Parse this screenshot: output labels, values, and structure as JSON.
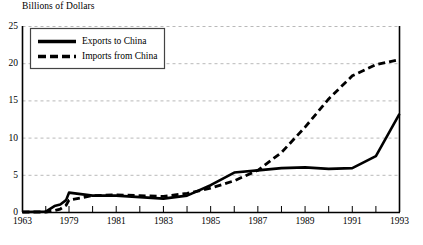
{
  "chart_data": {
    "type": "line",
    "title": "Billions of Dollars",
    "xlabel": "",
    "ylabel": "Billions of Dollars",
    "ylim": [
      0,
      25
    ],
    "yticks": [
      0,
      5,
      10,
      15,
      20,
      25
    ],
    "xticks": [
      "1963",
      "1979",
      "1981",
      "1983",
      "1985",
      "1987",
      "1989",
      "1991",
      "1993"
    ],
    "grid": "horizontal-dashed",
    "legend_position": "top-left-inside",
    "series": [
      {
        "name": "Exports to China",
        "style": "solid",
        "color": "#000000",
        "x": [
          1963,
          1971,
          1974,
          1976,
          1978,
          1979,
          1980,
          1981,
          1982,
          1983,
          1984,
          1985,
          1986,
          1987,
          1988,
          1989,
          1990,
          1991,
          1992,
          1993
        ],
        "values": [
          0.0,
          0.05,
          0.8,
          1.0,
          1.6,
          2.6,
          2.2,
          2.2,
          2.0,
          1.8,
          2.2,
          3.6,
          5.3,
          5.6,
          5.9,
          6.0,
          5.8,
          5.9,
          7.5,
          13.2
        ]
      },
      {
        "name": "Imports from China",
        "style": "dashed",
        "color": "#000000",
        "x": [
          1963,
          1971,
          1974,
          1976,
          1978,
          1979,
          1980,
          1981,
          1982,
          1983,
          1984,
          1985,
          1986,
          1987,
          1988,
          1989,
          1990,
          1991,
          1992,
          1993
        ],
        "values": [
          0.0,
          0.0,
          0.2,
          0.4,
          0.9,
          1.6,
          2.2,
          2.3,
          2.2,
          2.1,
          2.5,
          3.2,
          4.2,
          5.6,
          8.0,
          11.4,
          15.2,
          18.3,
          19.8,
          20.5
        ]
      }
    ]
  },
  "legend": {
    "items": [
      {
        "label": "Exports to China",
        "style": "solid"
      },
      {
        "label": "Imports from China",
        "style": "dashed"
      }
    ]
  }
}
